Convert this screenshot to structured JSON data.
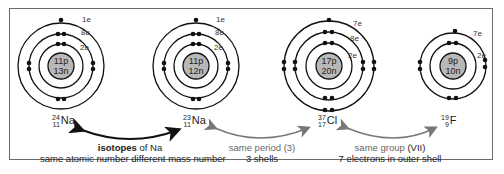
{
  "atoms": [
    {
      "id": "na24",
      "protons": "11p",
      "neutrons": "13n",
      "mass": "24",
      "atomic": "11",
      "symbol": "Na",
      "shells": [
        "2e",
        "8e",
        "1e"
      ]
    },
    {
      "id": "na23",
      "protons": "11p",
      "neutrons": "12n",
      "mass": "23",
      "atomic": "11",
      "symbol": "Na",
      "shells": [
        "2e",
        "8e",
        "1e"
      ]
    },
    {
      "id": "cl37",
      "protons": "17p",
      "neutrons": "20n",
      "mass": "37",
      "atomic": "17",
      "symbol": "Cl",
      "shells": [
        "2e",
        "8e",
        "7e"
      ]
    },
    {
      "id": "f19",
      "protons": "9p",
      "neutrons": "10n",
      "mass": "19",
      "atomic": "9",
      "symbol": "F",
      "shells": [
        "2e",
        "7e"
      ]
    }
  ],
  "captions": {
    "isotopes": {
      "bold": "isotopes",
      "rest": " of Na",
      "line2": "same atomic number different mass number"
    },
    "period": {
      "line1": "same period (3)",
      "line2": "3 shells"
    },
    "group": {
      "line1a": "same group ",
      "line1b": "(VII)",
      "line2": "7 electrons in outer shell"
    }
  },
  "colors": {
    "nucleus": "#b8b8b8",
    "arrow_black": "#111111",
    "arrow_grey": "#777777",
    "frame": "#6a6a6a"
  }
}
